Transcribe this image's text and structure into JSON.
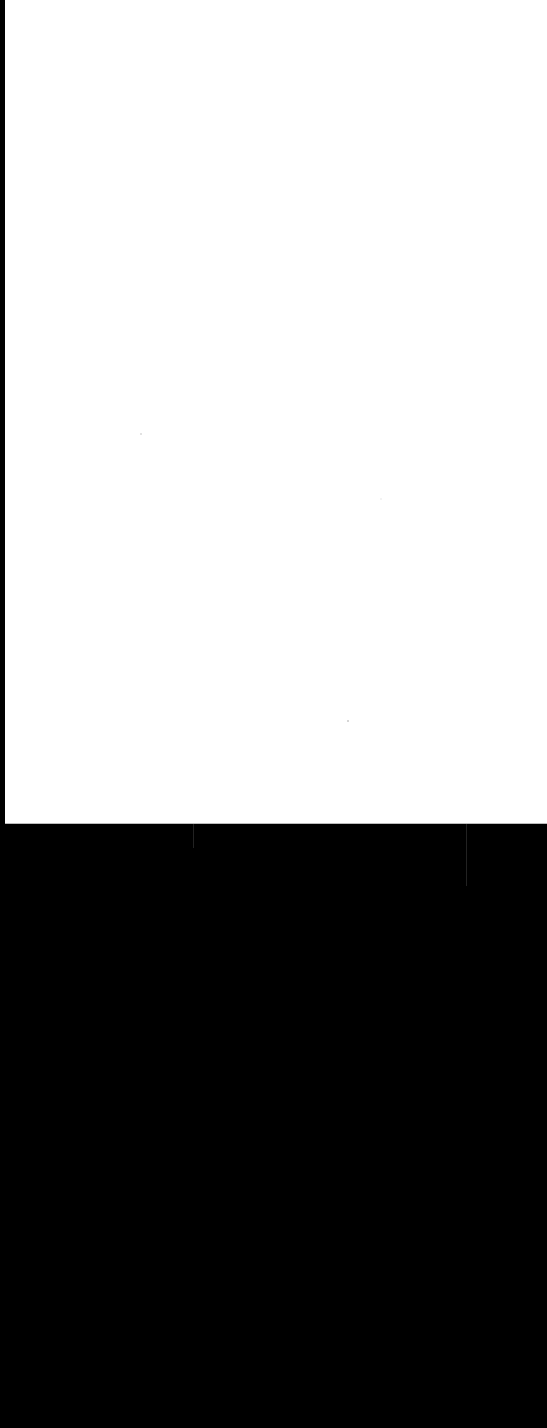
{
  "scene": {
    "description": "Blank white sheet of paper against a black background",
    "paper_color": "#ffffff",
    "background_color": "#000000"
  }
}
